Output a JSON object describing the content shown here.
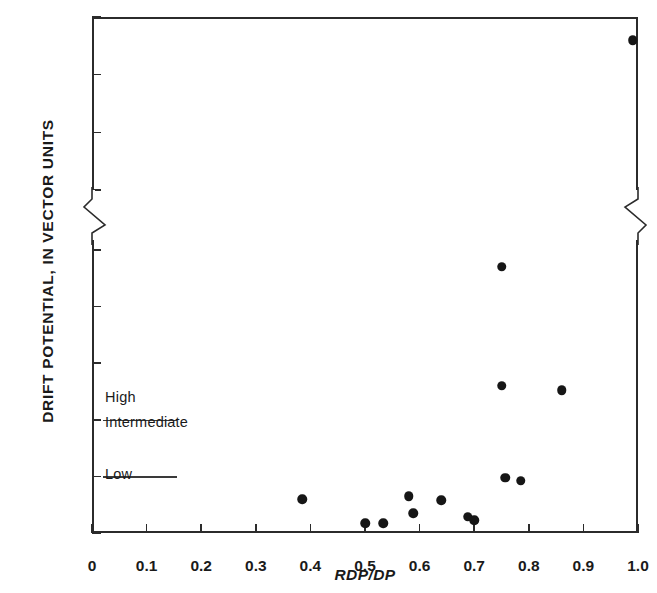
{
  "chart_data": {
    "type": "scatter",
    "title": "",
    "xlabel": "RDP/DP",
    "ylabel": "DRIFT POTENTIAL, IN VECTOR UNITS",
    "xlim": [
      0,
      1.0
    ],
    "ylim": [
      0,
      3000
    ],
    "grid": false,
    "legend": null,
    "axis_break": {
      "axis": "y",
      "from": 1100,
      "to": 1400,
      "note": "zigzag break symbol on both left and right spines between 1000 and 1500"
    },
    "xticks": [
      0,
      0.1,
      0.2,
      0.3,
      0.4,
      0.5,
      0.6,
      0.7,
      0.8,
      0.9,
      1.0
    ],
    "xticklabels": [
      "0",
      "0.1",
      "0.2",
      "0.3",
      "0.4",
      "0.5",
      "0.6",
      "0.7",
      "0.8",
      "0.9",
      "1.0"
    ],
    "yticks": [
      0,
      200,
      400,
      600,
      800,
      1000,
      1500,
      2000,
      2500,
      3000
    ],
    "yticklabels": [
      "0",
      "200",
      "400",
      "600",
      "800",
      "1000",
      "1500",
      "2000",
      "2500",
      "3000"
    ],
    "points": [
      {
        "x": 0.385,
        "y": 120
      },
      {
        "x": 0.5,
        "y": 35
      },
      {
        "x": 0.533,
        "y": 35
      },
      {
        "x": 0.58,
        "y": 130
      },
      {
        "x": 0.588,
        "y": 70
      },
      {
        "x": 0.64,
        "y": 115
      },
      {
        "x": 0.688,
        "y": 58
      },
      {
        "x": 0.7,
        "y": 45
      },
      {
        "x": 0.75,
        "y": 940
      },
      {
        "x": 0.75,
        "y": 520
      },
      {
        "x": 0.757,
        "y": 195
      },
      {
        "x": 0.785,
        "y": 185
      },
      {
        "x": 0.86,
        "y": 505
      },
      {
        "x": 0.99,
        "y": 2800
      }
    ],
    "annotations": [
      {
        "label": "High",
        "band_min": 400,
        "band_max": null
      },
      {
        "label": "Intermediate",
        "band_min": 200,
        "band_max": 400
      },
      {
        "label": "Low",
        "band_min": 0,
        "band_max": 200
      }
    ],
    "band_dividers": [
      400,
      200
    ],
    "band_divider_x_range": [
      0.02,
      0.155
    ]
  },
  "colors": {
    "marker": "#161616",
    "axis": "#2b2b2b",
    "band_line": "#3a3a3a",
    "background": "#ffffff"
  }
}
